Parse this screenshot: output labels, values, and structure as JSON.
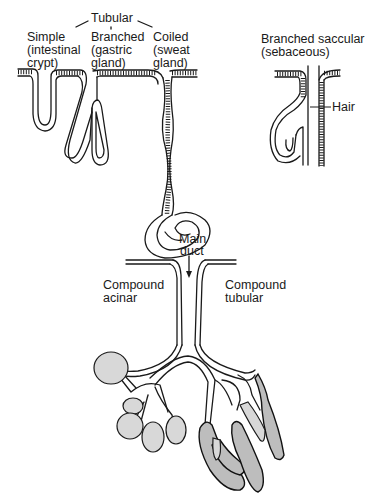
{
  "diagram": {
    "top_group_label": "Tubular",
    "labels": {
      "simple": [
        "Simple",
        "(intestinal",
        "crypt)"
      ],
      "branched": [
        "Branched",
        "(gastric",
        "gland)"
      ],
      "coiled": [
        "Coiled",
        "(sweat",
        "gland)"
      ],
      "saccular": [
        "Branched saccular",
        "(sebaceous)"
      ],
      "hair": "Hair",
      "main_duct": [
        "Main",
        "duct"
      ],
      "compound_acinar": [
        "Compound",
        "acinar"
      ],
      "compound_tubular": [
        "Compound",
        "tubular"
      ]
    },
    "colors": {
      "ink": "#1a1a1a",
      "fill": "#d8d8d8",
      "background": "#ffffff"
    }
  }
}
